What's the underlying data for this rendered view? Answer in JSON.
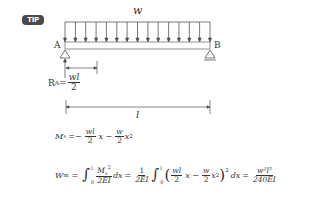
{
  "badge": {
    "label": "TIP"
  },
  "diagram": {
    "load_label": "w",
    "support_left_label": "A",
    "support_right_label": "B",
    "reaction": {
      "symbol": "R",
      "subscript": "A",
      "equals": "=",
      "numerator": "wl",
      "denominator": "2"
    },
    "span_label": "l",
    "colors": {
      "line": "#555555",
      "beam": "#777777"
    }
  },
  "equations": {
    "moment": {
      "lhs": "M",
      "lhs_sub": "x",
      "eq": "=−",
      "frac1_num": "wl",
      "frac1_den": "2",
      "term1": "x −",
      "frac2_num": "w",
      "frac2_den": "2",
      "term2": "x",
      "term2_exp": "2"
    },
    "energy": {
      "lhs": "W",
      "lhs_sub": "m",
      "eq1": "=",
      "int1_upper": "l",
      "int1_lower": "0",
      "frac1_num": "M",
      "frac1_num_sub": "x",
      "frac1_num_exp": "2",
      "frac1_den": "2EI",
      "dx1": "dx",
      "eq2": "=",
      "frac2_num": "1",
      "frac2_den": "2EI",
      "int2_upper": "l",
      "int2_lower": "0",
      "inner_frac1_num": "wl",
      "inner_frac1_den": "2",
      "inner_term1": "x −",
      "inner_frac2_num": "w",
      "inner_frac2_den": "2",
      "inner_term2": "x",
      "inner_term2_exp": "2",
      "outer_exp": "2",
      "dx2": "dx",
      "eq3": "=",
      "result_num": "w²l⁵",
      "result_den": "240EI"
    }
  }
}
